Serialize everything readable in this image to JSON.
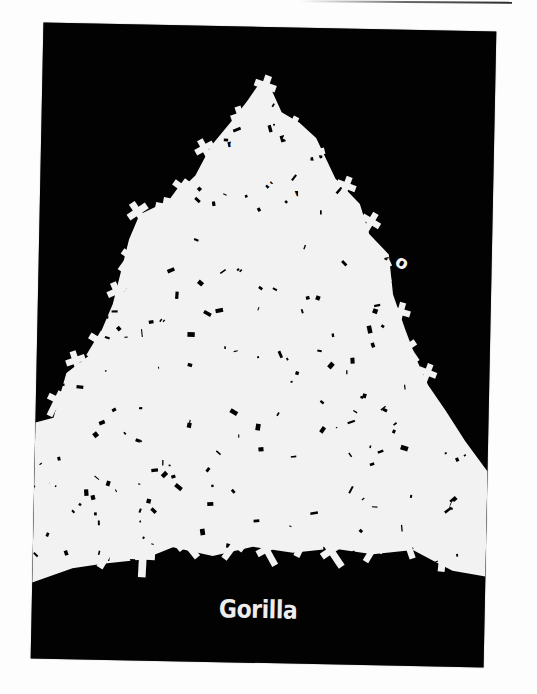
{
  "poster": {
    "caption": "Gorilla",
    "background_color": "#020202",
    "foreground_color": "#f2f2f2",
    "page_color": "#fdfdfd"
  },
  "artwork": {
    "subject": "pile of white crosses forming a triangular mound",
    "mound_outline": [
      [
        0,
        560
      ],
      [
        0,
        400
      ],
      [
        18,
        395
      ],
      [
        30,
        350
      ],
      [
        55,
        330
      ],
      [
        75,
        280
      ],
      [
        90,
        215
      ],
      [
        100,
        190
      ],
      [
        130,
        175
      ],
      [
        155,
        150
      ],
      [
        170,
        120
      ],
      [
        190,
        95
      ],
      [
        205,
        75
      ],
      [
        218,
        55
      ],
      [
        228,
        60
      ],
      [
        240,
        85
      ],
      [
        258,
        95
      ],
      [
        275,
        110
      ],
      [
        295,
        150
      ],
      [
        320,
        175
      ],
      [
        330,
        205
      ],
      [
        350,
        225
      ],
      [
        355,
        265
      ],
      [
        368,
        300
      ],
      [
        380,
        330
      ],
      [
        392,
        355
      ],
      [
        410,
        380
      ],
      [
        430,
        410
      ],
      [
        453,
        440
      ],
      [
        453,
        545
      ],
      [
        420,
        540
      ],
      [
        400,
        530
      ],
      [
        380,
        520
      ],
      [
        340,
        525
      ],
      [
        300,
        520
      ],
      [
        260,
        525
      ],
      [
        220,
        520
      ],
      [
        180,
        530
      ],
      [
        140,
        522
      ],
      [
        110,
        535
      ],
      [
        70,
        540
      ],
      [
        40,
        545
      ],
      [
        0,
        560
      ]
    ],
    "crosses": [
      {
        "x": 222,
        "y": 62,
        "r": 18,
        "s": 1.0
      },
      {
        "x": 200,
        "y": 92,
        "r": -20,
        "s": 0.9
      },
      {
        "x": 250,
        "y": 100,
        "r": 25,
        "s": 0.85
      },
      {
        "x": 275,
        "y": 128,
        "r": -15,
        "s": 0.9
      },
      {
        "x": 305,
        "y": 160,
        "r": 20,
        "s": 0.9
      },
      {
        "x": 330,
        "y": 195,
        "r": 30,
        "s": 0.9
      },
      {
        "x": 345,
        "y": 240,
        "r": -25,
        "s": 0.85
      },
      {
        "x": 362,
        "y": 285,
        "r": 15,
        "s": 0.9
      },
      {
        "x": 372,
        "y": 320,
        "r": -35,
        "s": 0.9
      },
      {
        "x": 390,
        "y": 345,
        "r": 20,
        "s": 0.85
      },
      {
        "x": 400,
        "y": 388,
        "r": -20,
        "s": 1.0
      },
      {
        "x": 418,
        "y": 420,
        "r": 30,
        "s": 0.95
      },
      {
        "x": 440,
        "y": 450,
        "r": -30,
        "s": 1.0
      },
      {
        "x": 425,
        "y": 480,
        "r": 25,
        "s": 0.9
      },
      {
        "x": 445,
        "y": 510,
        "r": -15,
        "s": 0.9
      },
      {
        "x": 410,
        "y": 525,
        "r": 5,
        "s": 1.0
      },
      {
        "x": 165,
        "y": 125,
        "r": -30,
        "s": 0.9
      },
      {
        "x": 140,
        "y": 165,
        "r": 35,
        "s": 0.9
      },
      {
        "x": 100,
        "y": 190,
        "r": -35,
        "s": 1.0
      },
      {
        "x": 125,
        "y": 185,
        "r": 10,
        "s": 0.9
      },
      {
        "x": 90,
        "y": 235,
        "r": 35,
        "s": 0.9
      },
      {
        "x": 80,
        "y": 270,
        "r": -25,
        "s": 0.9
      },
      {
        "x": 60,
        "y": 320,
        "r": 30,
        "s": 0.95
      },
      {
        "x": 40,
        "y": 340,
        "r": -20,
        "s": 0.9
      },
      {
        "x": 20,
        "y": 380,
        "r": 25,
        "s": 0.9
      },
      {
        "x": 10,
        "y": 420,
        "r": -35,
        "s": 0.9
      },
      {
        "x": 15,
        "y": 470,
        "r": 20,
        "s": 0.9
      },
      {
        "x": 40,
        "y": 520,
        "r": -40,
        "s": 0.95
      },
      {
        "x": 75,
        "y": 530,
        "r": 30,
        "s": 1.0
      },
      {
        "x": 110,
        "y": 535,
        "r": 2,
        "s": 1.1
      },
      {
        "x": 155,
        "y": 520,
        "r": -40,
        "s": 0.95
      },
      {
        "x": 200,
        "y": 520,
        "r": 35,
        "s": 0.95
      },
      {
        "x": 235,
        "y": 525,
        "r": -30,
        "s": 0.95
      },
      {
        "x": 270,
        "y": 515,
        "r": 25,
        "s": 0.95
      },
      {
        "x": 300,
        "y": 525,
        "r": -35,
        "s": 1.0
      },
      {
        "x": 340,
        "y": 520,
        "r": 30,
        "s": 0.9
      },
      {
        "x": 375,
        "y": 515,
        "r": -20,
        "s": 0.9
      }
    ],
    "letters": [
      {
        "ch": "S",
        "x": 195,
        "y": 130,
        "r": -35,
        "size": 20
      },
      {
        "ch": "a",
        "x": 210,
        "y": 150,
        "r": -35,
        "size": 20
      },
      {
        "ch": "d",
        "x": 228,
        "y": 162,
        "r": -30,
        "size": 20
      },
      {
        "ch": "d",
        "x": 246,
        "y": 175,
        "r": -25,
        "size": 20
      },
      {
        "ch": "a",
        "x": 265,
        "y": 185,
        "r": -20,
        "size": 20
      },
      {
        "ch": "m",
        "x": 285,
        "y": 196,
        "r": -20,
        "size": 20
      },
      {
        "ch": "o",
        "x": 355,
        "y": 235,
        "r": 30,
        "size": 18
      }
    ]
  }
}
